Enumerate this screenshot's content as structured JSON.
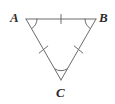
{
  "figure": {
    "kind": "geometry-diagram",
    "shape": "equilateral-triangle",
    "background_color": "#ffffff",
    "stroke_color": "#6b6b6b",
    "label_color": "#2b2b2b",
    "stroke_width": 1,
    "canvas": {
      "width": 115,
      "height": 104
    },
    "vertices": [
      {
        "name": "A",
        "label": "A",
        "x": 26,
        "y": 19,
        "label_x": 10,
        "label_y": 11
      },
      {
        "name": "B",
        "label": "B",
        "x": 96,
        "y": 19,
        "label_x": 99,
        "label_y": 11
      },
      {
        "name": "C",
        "label": "C",
        "x": 61,
        "y": 80,
        "label_x": 56,
        "label_y": 86
      }
    ],
    "sides": [
      {
        "name": "AB",
        "from": "A",
        "to": "B",
        "tick_marks": 1,
        "tick_label": "single-tick"
      },
      {
        "name": "AC",
        "from": "A",
        "to": "C",
        "tick_marks": 1,
        "tick_label": "single-tick"
      },
      {
        "name": "BC",
        "from": "B",
        "to": "C",
        "tick_marks": 1,
        "tick_label": "single-tick"
      }
    ],
    "angle_arcs": [
      {
        "at": "A",
        "arcs": 1
      },
      {
        "at": "B",
        "arcs": 1
      },
      {
        "at": "C",
        "arcs": 1
      }
    ]
  }
}
